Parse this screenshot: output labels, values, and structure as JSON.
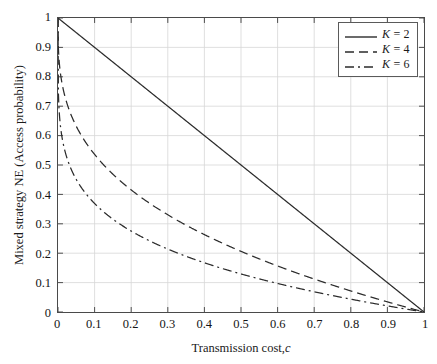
{
  "chart_data": {
    "type": "line",
    "title": "",
    "xlabel": "Transmission cost, c",
    "xlabel_main": "Transmission cost,",
    "xlabel_var": "c",
    "ylabel": "Mixed strategy NE (Access probability)",
    "xlim": [
      0,
      1
    ],
    "ylim": [
      0,
      1
    ],
    "grid": true,
    "legend_position": "top-right",
    "x_ticks": [
      "0",
      "0.1",
      "0.2",
      "0.3",
      "0.4",
      "0.5",
      "0.6",
      "0.7",
      "0.8",
      "0.9",
      "1"
    ],
    "x_tick_values": [
      0,
      0.1,
      0.2,
      0.3,
      0.4,
      0.5,
      0.6,
      0.7,
      0.8,
      0.9,
      1
    ],
    "y_ticks": [
      "0",
      "0.1",
      "0.2",
      "0.3",
      "0.4",
      "0.5",
      "0.6",
      "0.7",
      "0.8",
      "0.9",
      "1"
    ],
    "y_tick_values": [
      0,
      0.1,
      0.2,
      0.3,
      0.4,
      0.5,
      0.6,
      0.7,
      0.8,
      0.9,
      1
    ],
    "x": [
      0,
      0.005,
      0.01,
      0.02,
      0.03,
      0.04,
      0.05,
      0.06,
      0.08,
      0.1,
      0.125,
      0.15,
      0.175,
      0.2,
      0.25,
      0.3,
      0.35,
      0.4,
      0.45,
      0.5,
      0.55,
      0.6,
      0.65,
      0.7,
      0.75,
      0.8,
      0.85,
      0.9,
      0.95,
      1
    ],
    "series": [
      {
        "name": "K = 2",
        "legend_main": "K",
        "legend_rest": " = 2",
        "K": 2,
        "style": "solid",
        "color": "#2b2b2b",
        "formula": "p = 1 - c^(1/(K-1))",
        "values": [
          1,
          0.995,
          0.99,
          0.98,
          0.97,
          0.96,
          0.95,
          0.94,
          0.92,
          0.9,
          0.875,
          0.85,
          0.825,
          0.8,
          0.75,
          0.7,
          0.65,
          0.6,
          0.55,
          0.5,
          0.45,
          0.4,
          0.35,
          0.3,
          0.25,
          0.2,
          0.15,
          0.1,
          0.05,
          0
        ]
      },
      {
        "name": "K = 4",
        "legend_main": "K",
        "legend_rest": " = 4",
        "K": 4,
        "style": "dashed",
        "color": "#2b2b2b",
        "formula": "p = 1 - c^(1/(K-1))",
        "values": [
          1,
          0.829,
          0.785,
          0.729,
          0.689,
          0.658,
          0.632,
          0.608,
          0.569,
          0.536,
          0.5,
          0.469,
          0.441,
          0.415,
          0.37,
          0.331,
          0.295,
          0.263,
          0.234,
          0.206,
          0.181,
          0.157,
          0.134,
          0.112,
          0.092,
          0.072,
          0.053,
          0.035,
          0.017,
          0
        ]
      },
      {
        "name": "K = 6",
        "legend_main": "K",
        "legend_rest": " = 6",
        "K": 6,
        "style": "dashdot",
        "color": "#2b2b2b",
        "formula": "p = 1 - c^(1/(K-1))",
        "values": [
          1,
          0.654,
          0.602,
          0.545,
          0.507,
          0.479,
          0.457,
          0.438,
          0.406,
          0.369,
          0.346,
          0.321,
          0.3,
          0.275,
          0.243,
          0.213,
          0.188,
          0.165,
          0.144,
          0.129,
          0.112,
          0.096,
          0.081,
          0.067,
          0.054,
          0.042,
          0.031,
          0.02,
          0.01,
          0
        ]
      }
    ],
    "annotations": []
  }
}
